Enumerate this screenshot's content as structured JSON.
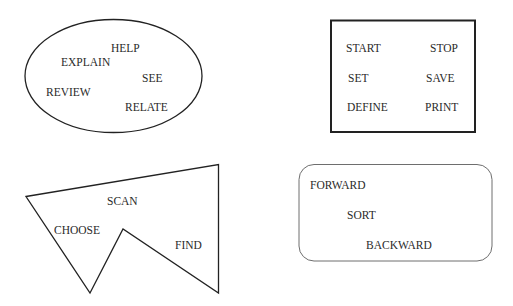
{
  "diagram": {
    "groups": [
      {
        "shape": "ellipse",
        "words": [
          "HELP",
          "EXPLAIN",
          "SEE",
          "REVIEW",
          "RELATE"
        ]
      },
      {
        "shape": "rectangle",
        "words": [
          "START",
          "STOP",
          "SET",
          "SAVE",
          "DEFINE",
          "PRINT"
        ]
      },
      {
        "shape": "concave-polygon",
        "words": [
          "SCAN",
          "CHOOSE",
          "FIND"
        ]
      },
      {
        "shape": "rounded-rectangle",
        "words": [
          "FORWARD",
          "SORT",
          "BACKWARD"
        ]
      }
    ],
    "colors": {
      "stroke": "#222222",
      "text": "#2a2a2a",
      "rounded_stroke": "#6e6e6e",
      "background": "#ffffff"
    }
  }
}
